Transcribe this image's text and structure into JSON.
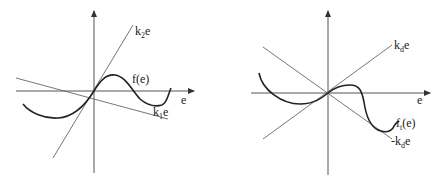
{
  "panels": [
    {
      "id": "left",
      "x_axis_label": "e",
      "curve_label": {
        "main": "f(e)"
      },
      "upper_line_label": {
        "k": "k",
        "sub": "2",
        "var": "e"
      },
      "lower_line_label": {
        "k": "k",
        "sub": "1",
        "var": "e"
      },
      "description": "Nonlinearity f(e) bounded by sector lines k1e and k2e"
    },
    {
      "id": "right",
      "x_axis_label": "e",
      "curve_label": {
        "f": "f",
        "sub": "t",
        "arg": "(e)"
      },
      "upper_line_label": {
        "k": "k",
        "sub": "d",
        "var": "e"
      },
      "lower_line_label": {
        "sign": "-",
        "k": "k",
        "sub": "d",
        "var": "e"
      },
      "description": "Nonlinearity ft(e) bounded by lines kde and -kde"
    }
  ],
  "colors": {
    "curve": "#222222",
    "lines": "#666666",
    "axes": "#555555",
    "background": "#ffffff"
  }
}
